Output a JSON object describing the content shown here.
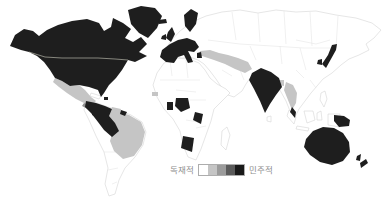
{
  "legend": {
    "left_label": "독재적",
    "right_label": "민주적",
    "swatches": [
      "#ffffff",
      "#c5c5c5",
      "#9b9b9b",
      "#5a5a5a",
      "#191919"
    ]
  },
  "map": {
    "colors": {
      "democratic": "#1e1e1e",
      "intermediate_light": "#c5c5c5",
      "intermediate_mid": "#8f8f8f",
      "autocratic": "#ffffff",
      "border": "#d2d2d2",
      "inner_border": "#e0e0e0",
      "us_canada_border": "#cfcfc0"
    },
    "regions": {
      "eurasia": "autocratic",
      "africa": "autocratic",
      "south-america": "autocratic",
      "madagascar": "autocratic",
      "sumatra": "autocratic",
      "java": "autocratic",
      "borneo": "autocratic",
      "sulawesi": "autocratic",
      "new-guinea-west": "autocratic",
      "philippines": "autocratic",
      "cuba": "autocratic",
      "sri-lanka": "autocratic",
      "mexico": "intermediate_light",
      "guatemala": "intermediate_mid",
      "guyana-suriname": "intermediate_light",
      "brazil": "intermediate_light",
      "senegal": "intermediate_light",
      "turkey-iran": "intermediate_light",
      "bangladesh": "intermediate_light",
      "myanmar-thailand": "intermediate_light",
      "north-america": "democratic",
      "greenland": "democratic",
      "iceland": "democratic",
      "scandinavia": "democratic",
      "uk": "democratic",
      "ireland": "democratic",
      "europe-west": "democratic",
      "greece": "democratic",
      "honduras-nicaragua": "democratic",
      "costa-rica-panama": "democratic",
      "hispaniola": "democratic",
      "andean-south-america": "democratic",
      "french-guiana": "democratic",
      "ghana": "democratic",
      "nigeria": "democratic",
      "east-africa": "democratic",
      "zimbabwe-botswana": "democratic",
      "india": "democratic",
      "malay-peninsula": "democratic",
      "japan": "democratic",
      "south-korea": "democratic",
      "papua-new-guinea": "democratic",
      "australia": "democratic",
      "new-zealand-north": "democratic",
      "new-zealand-south": "democratic"
    }
  }
}
